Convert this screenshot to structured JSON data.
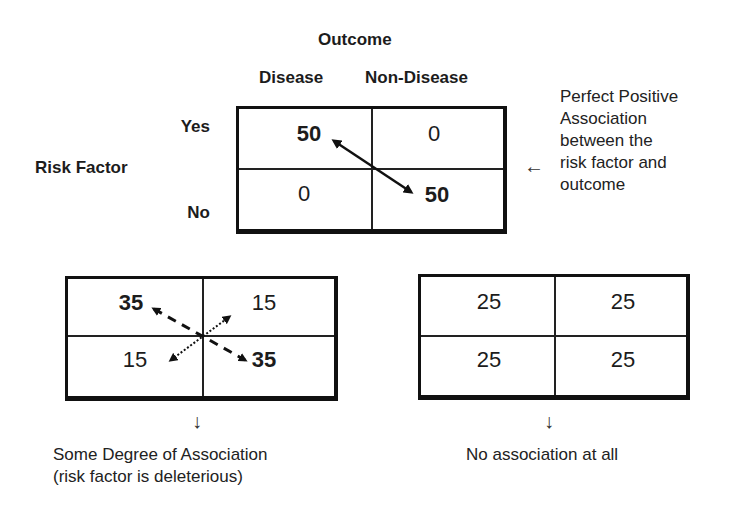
{
  "header": {
    "outcome_label": "Outcome",
    "columns": [
      "Disease",
      "Non-Disease"
    ],
    "row_axis_label": "Risk Factor",
    "rows": [
      "Yes",
      "No"
    ]
  },
  "tables": [
    {
      "id": "perfect",
      "cells": [
        [
          "50",
          "0"
        ],
        [
          "0",
          "50"
        ]
      ],
      "bold_cells": [
        "50",
        "50"
      ],
      "arrows": [
        {
          "style": "solid",
          "from": "top-left",
          "to": "bottom-right",
          "double_headed": true
        }
      ],
      "annotation": {
        "pointer_icon": "left-arrow",
        "lines": [
          "Perfect Positive",
          "Association",
          "between the",
          "risk factor and",
          "outcome"
        ]
      }
    },
    {
      "id": "some",
      "cells": [
        [
          "35",
          "15"
        ],
        [
          "15",
          "35"
        ]
      ],
      "arrows": [
        {
          "style": "dashed",
          "from": "top-left",
          "to": "bottom-right",
          "double_headed": true
        },
        {
          "style": "dotted",
          "from": "bottom-left",
          "to": "top-right",
          "double_headed": true
        }
      ],
      "annotation": {
        "pointer_icon": "down-arrow",
        "lines": [
          "Some Degree of Association",
          "(risk factor is deleterious)"
        ]
      }
    },
    {
      "id": "none",
      "cells": [
        [
          "25",
          "25"
        ],
        [
          "25",
          "25"
        ]
      ],
      "annotation": {
        "pointer_icon": "down-arrow",
        "lines": [
          "No association at all"
        ]
      }
    }
  ],
  "glyphs": {
    "left_arrow": "←",
    "down_arrow": "↓"
  },
  "colors": {
    "border": "#111111",
    "text": "#1c1c1c",
    "background": "#ffffff"
  }
}
